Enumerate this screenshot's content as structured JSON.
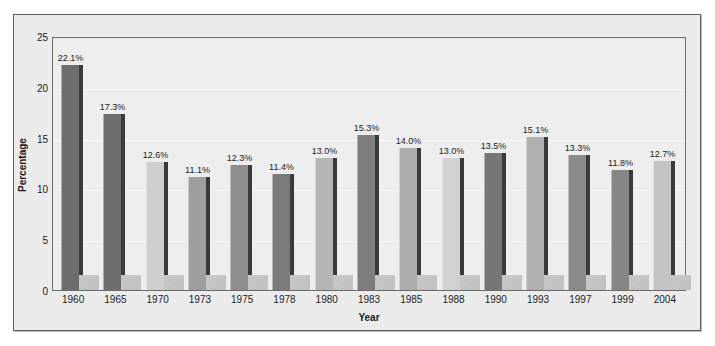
{
  "chart_data": {
    "type": "bar",
    "title": "",
    "xlabel": "Year",
    "ylabel": "Percentage",
    "categories": [
      "1960",
      "1965",
      "1970",
      "1973",
      "1975",
      "1978",
      "1980",
      "1983",
      "1985",
      "1988",
      "1990",
      "1993",
      "1997",
      "1999",
      "2004"
    ],
    "values": [
      22.1,
      17.3,
      12.6,
      11.1,
      12.3,
      11.4,
      13.0,
      15.3,
      14.0,
      13.0,
      13.5,
      15.1,
      13.3,
      11.8,
      12.7
    ],
    "data_labels": [
      "22.1%",
      "17.3%",
      "12.6%",
      "11.1%",
      "12.3%",
      "11.4%",
      "13.0%",
      "15.3%",
      "14.0%",
      "13.0%",
      "13.5%",
      "15.1%",
      "13.3%",
      "11.8%",
      "12.7%"
    ],
    "bar_colors": [
      "#6d6d6d",
      "#6d6d6d",
      "#cfcfcf",
      "#9e9e9e",
      "#8e8e8e",
      "#7a7a7a",
      "#b5b5b5",
      "#7d7d7d",
      "#adadad",
      "#d2d2d2",
      "#777777",
      "#b0b0b0",
      "#8a8a8a",
      "#868686",
      "#c4c4c4"
    ],
    "ylim": [
      0,
      25
    ],
    "yticks": [
      0,
      5,
      10,
      15,
      20,
      25
    ],
    "ytick_labels": [
      "0",
      "5",
      "10",
      "15",
      "20",
      "25"
    ],
    "grid": true,
    "grid_color": "#f9f9f9",
    "legend": "none",
    "plot_background": "#eeeeee",
    "figure_background": "#ececec",
    "text_color": "#1b1b1b"
  }
}
